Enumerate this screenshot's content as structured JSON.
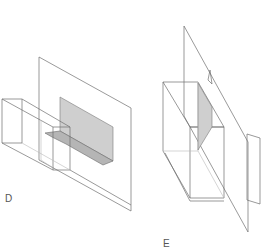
{
  "figures": [
    {
      "id": "D",
      "label": "D",
      "description": "Rectangular prism piercing a vertical plane with a shaded L-shaped intersection"
    },
    {
      "id": "E",
      "label": "E",
      "description": "Vertical plane cutting diagonally through a rectangular box with shaded triangular section and small flag"
    }
  ],
  "colors": {
    "line": "#6e6e6e",
    "shade": "#cfcfcf",
    "shade_dark": "#b5b5b5",
    "background": "#ffffff"
  }
}
